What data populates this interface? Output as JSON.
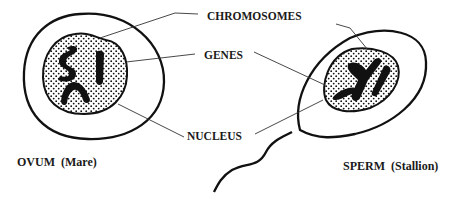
{
  "diagram": {
    "labels": {
      "chromosomes": "CHROMOSOMES",
      "genes": "GENES",
      "nucleus": "NUCLEUS"
    },
    "cells": [
      {
        "id": "ovum",
        "caption": "OVUM  (Mare)"
      },
      {
        "id": "sperm",
        "caption": "SPERM  (Stallion)"
      }
    ],
    "colors": {
      "ink": "#111111",
      "background": "#ffffff"
    }
  }
}
